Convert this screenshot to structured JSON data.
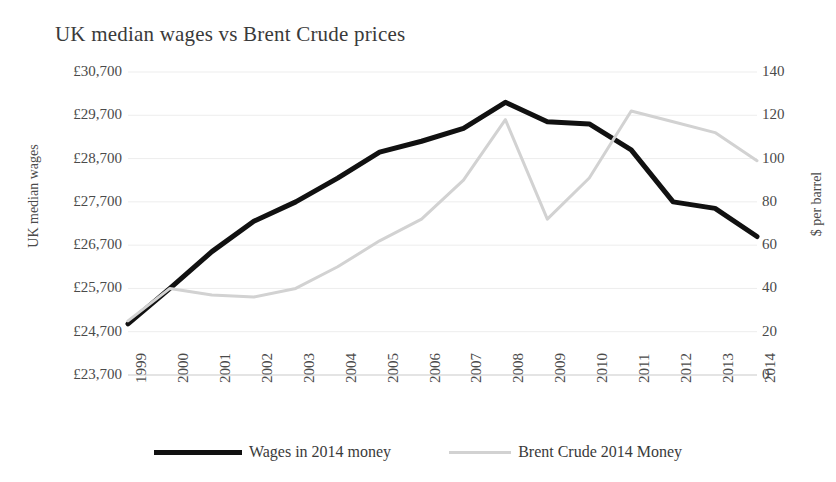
{
  "chart_data": {
    "type": "line",
    "title": "UK median wages vs Brent Crude prices",
    "xlabel": "",
    "ylabel": "UK median wages",
    "y2label": "$ per barrel",
    "categories": [
      "1999",
      "2000",
      "2001",
      "2002",
      "2003",
      "2004",
      "2005",
      "2006",
      "2007",
      "2008",
      "2009",
      "2010",
      "2011",
      "2012",
      "2013",
      "2014"
    ],
    "ylim": [
      23700,
      30700
    ],
    "yticks": [
      "£23,700",
      "£24,700",
      "£25,700",
      "£26,700",
      "£27,700",
      "£28,700",
      "£29,700",
      "£30,700"
    ],
    "ytick_values": [
      23700,
      24700,
      25700,
      26700,
      27700,
      28700,
      29700,
      30700
    ],
    "y2lim": [
      0,
      140
    ],
    "y2ticks": [
      "0",
      "20",
      "40",
      "60",
      "80",
      "100",
      "120",
      "140"
    ],
    "y2tick_values": [
      0,
      20,
      40,
      60,
      80,
      100,
      120,
      140
    ],
    "grid": true,
    "legend_position": "bottom",
    "series": [
      {
        "name": "Wages in 2014 money",
        "axis": "left",
        "color": "#111111",
        "width": 5,
        "values": [
          24880,
          25700,
          26550,
          27250,
          27700,
          28250,
          28850,
          29100,
          29400,
          30000,
          29550,
          29500,
          28900,
          27700,
          27550,
          26900
        ]
      },
      {
        "name": "Brent Crude 2014 Money",
        "axis": "right",
        "color": "#d2d2d2",
        "width": 3,
        "values": [
          25,
          40,
          37,
          36,
          40,
          50,
          62,
          72,
          90,
          118,
          72,
          91,
          122,
          117,
          112,
          99
        ]
      }
    ]
  },
  "legend": {
    "items": [
      {
        "label": "Wages in 2014 money",
        "style": "wages"
      },
      {
        "label": "Brent Crude 2014 Money",
        "style": "crude"
      }
    ]
  }
}
